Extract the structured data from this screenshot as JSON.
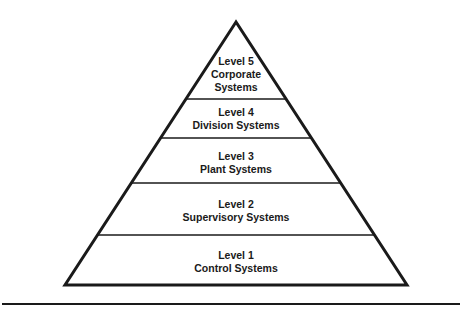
{
  "diagram": {
    "type": "pyramid",
    "levels": [
      {
        "id": "level-5",
        "title": "Level 5",
        "subtitle": "Corporate",
        "subtitle2": "Systems"
      },
      {
        "id": "level-4",
        "title": "Level 4",
        "subtitle": "Division Systems"
      },
      {
        "id": "level-3",
        "title": "Level 3",
        "subtitle": "Plant Systems"
      },
      {
        "id": "level-2",
        "title": "Level 2",
        "subtitle": "Supervisory Systems"
      },
      {
        "id": "level-1",
        "title": "Level 1",
        "subtitle": "Control Systems"
      }
    ],
    "colors": {
      "stroke": "#1a1a1a",
      "background": "#ffffff"
    }
  }
}
